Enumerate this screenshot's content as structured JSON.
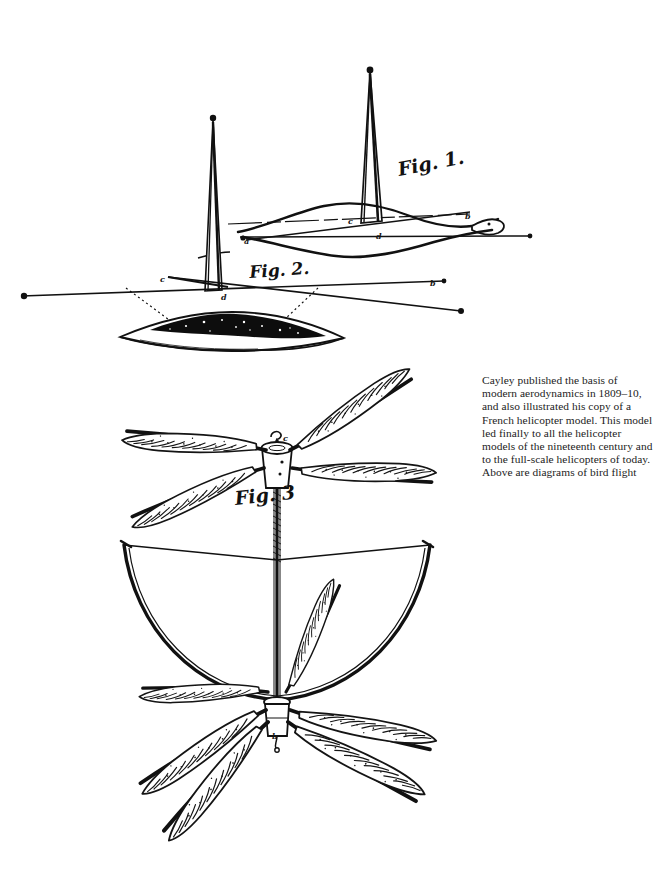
{
  "document": {
    "kind": "engraved-plate",
    "background_color": "#ffffff",
    "ink_color": "#101010",
    "width": 668,
    "height": 896
  },
  "caption": {
    "text": "Cayley published the basis of modern aerodynamics in 1809–10, and also illustrated his copy of a French helicopter model. This model led finally to all the helicopter models of the nineteenth century and to the full-scale helicopters of today. Above are diagrams of bird flight",
    "lines": [
      "Cayley published the basis of modern",
      "aerodynamics in 1809–10, and also",
      "illustrated his copy of a French",
      "helicopter model. This model led",
      "finally to all the helicopter models",
      "of the nineteenth century and to the",
      "full-scale helicopters of today. Above",
      "are diagrams of bird flight"
    ],
    "color": "#1c1c1c"
  },
  "figures": [
    {
      "id": "fig1",
      "label": "Fig. 1.",
      "description": "Bird-flight diagram: wing cross-section seen edge-on with a tall vertical spire rising from the chord line; intersecting straight lines mark force directions.",
      "point_labels": [
        "a",
        "b",
        "c",
        "d"
      ]
    },
    {
      "id": "fig2",
      "label": "Fig. 2.",
      "description": "Bird-flight diagram: long crossing straight lines with end dots above a solid dark lens-shaped airfoil section joined by dotted projection lines.",
      "point_labels": [
        "b",
        "c",
        "d"
      ]
    },
    {
      "id": "fig3",
      "label": "Fig. 3",
      "description": "French helicopter model: two contra-rotating four-feather rotors on a common vertical shaft, with a bow-shaped spring frame between them.",
      "point_labels": [
        "c",
        "b"
      ]
    }
  ],
  "points": [
    {
      "letter": "a",
      "x": 244,
      "y": 236,
      "figure": "fig1"
    },
    {
      "letter": "b",
      "x": 465,
      "y": 211,
      "figure": "fig1"
    },
    {
      "letter": "c",
      "x": 348,
      "y": 216,
      "figure": "fig1"
    },
    {
      "letter": "d",
      "x": 376,
      "y": 231,
      "figure": "fig1"
    },
    {
      "letter": "c",
      "x": 160,
      "y": 274,
      "figure": "fig2"
    },
    {
      "letter": "b",
      "x": 430,
      "y": 278,
      "figure": "fig2"
    },
    {
      "letter": "d",
      "x": 221,
      "y": 292,
      "figure": "fig2"
    },
    {
      "letter": "c",
      "x": 283,
      "y": 433,
      "figure": "fig3"
    },
    {
      "letter": "b",
      "x": 272,
      "y": 731,
      "figure": "fig3"
    }
  ]
}
